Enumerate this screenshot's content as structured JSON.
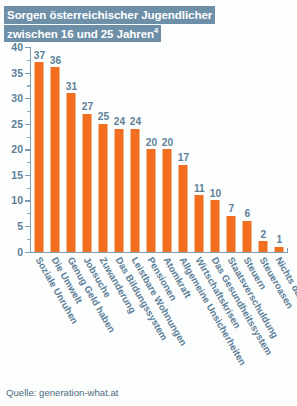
{
  "title": {
    "line1": "Sorgen österreichischer Jugendlicher",
    "line2": "zwischen 16 und 25 Jahren",
    "superscript": "4"
  },
  "source": "Quelle: generation-what.at",
  "colors": {
    "bar": "#f26f21",
    "text_blue": "#5d8098",
    "banner": "#6e8fa8",
    "axis": "#7d9cb3",
    "background": "#fcfdfd"
  },
  "chart_data": {
    "type": "bar",
    "title": "Sorgen österreichischer Jugendlicher zwischen 16 und 25 Jahren",
    "xlabel": "",
    "ylabel": "",
    "ylim": [
      0,
      40
    ],
    "yticks": [
      0,
      5,
      10,
      15,
      20,
      25,
      30,
      35,
      40
    ],
    "ytick_labels": [
      "0",
      "5",
      "10",
      "15",
      "20",
      "25",
      "30",
      "35",
      "40"
    ],
    "minor_tick_step": 2.5,
    "grid": false,
    "legend": false,
    "data_labels": true,
    "categories": [
      "Soziale Unruhen",
      "Die Umwelt",
      "Genug Geld haben",
      "Jobsuche",
      "Zuwanderung",
      "Das Bildungssystem",
      "Leistbare Wohnungen",
      "Pensionen",
      "Atomkraft",
      "Allgemeine Unsicherheiten",
      "Wirtschaftskrisen",
      "Das Gesundheitssystem",
      "Staatsverschuldung",
      "Steuern",
      "Steueroasen",
      "Nichts davon"
    ],
    "values": [
      37,
      36,
      31,
      27,
      25,
      24,
      24,
      20,
      20,
      17,
      11,
      10,
      7,
      6,
      2,
      1
    ]
  }
}
